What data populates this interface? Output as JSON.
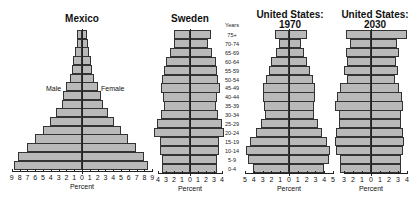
{
  "chart_data": [
    {
      "type": "bar",
      "orientation": "population-pyramid",
      "title": "Mexico",
      "xlabel": "Percent",
      "legend": [
        "Male",
        "Female"
      ],
      "categories": [
        "75+",
        "70-74",
        "65-69",
        "60-64",
        "55-59",
        "50-54",
        "45-49",
        "40-44",
        "35-39",
        "30-34",
        "25-29",
        "20-24",
        "15-19",
        "10-14",
        "5-9",
        "0-4"
      ],
      "series": [
        {
          "name": "Male",
          "values": [
            0.6,
            0.7,
            0.9,
            1.1,
            1.3,
            1.6,
            2.0,
            2.4,
            2.6,
            3.3,
            4.1,
            5.0,
            6.0,
            7.1,
            8.2,
            8.7
          ]
        },
        {
          "name": "Female",
          "values": [
            0.7,
            0.8,
            0.9,
            1.1,
            1.3,
            1.6,
            2.0,
            2.4,
            2.7,
            3.3,
            4.1,
            5.0,
            5.9,
            6.9,
            7.9,
            8.5
          ]
        }
      ],
      "xticks_left": [
        "9",
        "8",
        "7",
        "6",
        "5",
        "4",
        "3",
        "2",
        "1",
        "0"
      ],
      "xticks_right": [
        "1",
        "2",
        "3",
        "4",
        "5",
        "6",
        "7",
        "8",
        "9"
      ],
      "xlim": [
        -9,
        9
      ]
    },
    {
      "type": "bar",
      "orientation": "population-pyramid",
      "title": "Sweden",
      "xlabel": "Percent",
      "categories": [
        "75+",
        "70-74",
        "65-69",
        "60-64",
        "55-59",
        "50-54",
        "45-49",
        "40-44",
        "35-39",
        "30-34",
        "25-29",
        "20-24",
        "15-19",
        "10-14",
        "5-9",
        "0-4"
      ],
      "series": [
        {
          "name": "Male",
          "values": [
            2.0,
            2.0,
            2.5,
            3.0,
            3.3,
            3.5,
            3.6,
            3.4,
            3.3,
            3.6,
            4.1,
            4.5,
            3.7,
            3.7,
            3.5,
            3.5
          ]
        },
        {
          "name": "Female",
          "values": [
            2.6,
            2.3,
            2.7,
            3.2,
            3.4,
            3.5,
            3.7,
            3.4,
            3.3,
            3.5,
            4.0,
            4.3,
            3.6,
            3.6,
            3.4,
            3.4
          ]
        }
      ],
      "xticks_left": [
        "4",
        "3",
        "2",
        "1",
        "0"
      ],
      "xticks_right": [
        "1",
        "2",
        "3",
        "4"
      ],
      "xlim": [
        -4,
        4
      ],
      "age_axis_label": "Years"
    },
    {
      "type": "bar",
      "orientation": "population-pyramid",
      "title": "United States: 1970",
      "xlabel": "Percent",
      "categories": [
        "75+",
        "70-74",
        "65-69",
        "60-64",
        "55-59",
        "50-54",
        "45-49",
        "40-44",
        "35-39",
        "30-34",
        "25-29",
        "20-24",
        "15-19",
        "10-14",
        "5-9",
        "0-4"
      ],
      "series": [
        {
          "name": "Male",
          "values": [
            1.6,
            1.1,
            1.5,
            2.0,
            2.3,
            2.6,
            2.9,
            2.9,
            2.8,
            2.7,
            3.2,
            3.8,
            4.4,
            4.9,
            4.7,
            4.1
          ]
        },
        {
          "name": "Female",
          "values": [
            2.0,
            1.4,
            1.7,
            2.0,
            2.4,
            2.7,
            2.9,
            2.9,
            2.8,
            2.8,
            3.3,
            3.8,
            4.3,
            4.7,
            4.6,
            4.0
          ]
        }
      ],
      "xticks_left": [
        "5",
        "4",
        "3",
        "2",
        "1",
        "0"
      ],
      "xticks_right": [
        "1",
        "2",
        "3",
        "4",
        "5"
      ],
      "xlim": [
        -5,
        5
      ]
    },
    {
      "type": "bar",
      "orientation": "population-pyramid",
      "title": "United States: 2030",
      "xlabel": "Percent",
      "categories": [
        "75+",
        "70-74",
        "65-69",
        "60-64",
        "55-59",
        "50-54",
        "45-49",
        "40-44",
        "35-39",
        "30-34",
        "25-29",
        "20-24",
        "15-19",
        "10-14",
        "5-9",
        "0-4"
      ],
      "series": [
        {
          "name": "Male",
          "values": [
            2.8,
            2.3,
            2.8,
            2.7,
            3.0,
            2.7,
            3.4,
            3.8,
            4.0,
            3.6,
            3.6,
            3.9,
            4.0,
            3.9,
            3.5,
            3.5
          ]
        },
        {
          "name": "Female",
          "values": [
            4.0,
            2.9,
            3.1,
            2.8,
            3.0,
            2.7,
            3.1,
            3.4,
            3.6,
            3.3,
            3.3,
            3.6,
            3.7,
            3.6,
            3.3,
            3.3
          ]
        }
      ],
      "xticks_left": [
        "3",
        "2",
        "1",
        "0"
      ],
      "xticks_right": [
        "1",
        "2",
        "3",
        "4"
      ],
      "xlim": [
        -3,
        4
      ]
    }
  ],
  "labels": {
    "male": "Male",
    "female": "Female",
    "years": "Years",
    "percent": "Percent"
  }
}
